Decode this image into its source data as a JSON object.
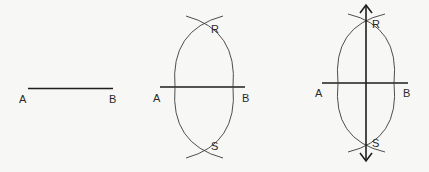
{
  "panels": [
    {
      "step": 1,
      "description": "Line segment AB",
      "labels": {
        "a": "A",
        "b": "B"
      }
    },
    {
      "step": 2,
      "description": "Arcs drawn from A and B intersecting at R and S",
      "labels": {
        "a": "A",
        "b": "B",
        "r": "R",
        "s": "S"
      }
    },
    {
      "step": 3,
      "description": "Line RS drawn through intersections, bisecting AB perpendicularly",
      "labels": {
        "a": "A",
        "b": "B",
        "r": "R",
        "s": "S"
      }
    }
  ],
  "colors": {
    "ink": "#1e1e1e",
    "background": "#f7f7f6"
  }
}
